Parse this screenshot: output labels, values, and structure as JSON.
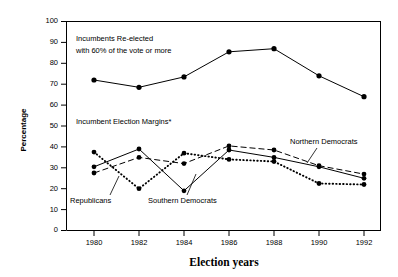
{
  "chart_data": {
    "type": "line",
    "title": "",
    "xlabel": "Election years",
    "ylabel": "Percentage",
    "x": [
      1980,
      1982,
      1984,
      1986,
      1988,
      1990,
      1992
    ],
    "xtick_labels": [
      "1980",
      "1982",
      "1984",
      "1986",
      "1988",
      "1990",
      "1992"
    ],
    "ytick_labels": [
      "0",
      "10",
      "20",
      "30",
      "40",
      "50",
      "60",
      "70",
      "80",
      "90",
      "100"
    ],
    "yticks": [
      0,
      10,
      20,
      30,
      40,
      50,
      60,
      70,
      80,
      90,
      100
    ],
    "ylim": [
      0,
      100
    ],
    "xlim": [
      1979,
      1993
    ],
    "grid": false,
    "legend_position": "inline-annotations",
    "series": [
      {
        "name": "Incumbents Re-elected with 60% of the vote or more",
        "style": "solid",
        "marker": "filled-circle",
        "values": [
          72,
          68.5,
          73.5,
          85.5,
          87,
          74,
          64
        ]
      },
      {
        "name": "Northern Democrats",
        "style": "dashed",
        "marker": "filled-circle",
        "values": [
          27.5,
          35,
          32,
          40.5,
          38.5,
          31,
          27
        ]
      },
      {
        "name": "Southern Democrats",
        "style": "solid",
        "marker": "filled-circle",
        "values": [
          30.5,
          39,
          19,
          38.5,
          35,
          30.5,
          25
        ]
      },
      {
        "name": "Republicans",
        "style": "dotted",
        "marker": "filled-circle",
        "values": [
          37.5,
          20,
          37,
          34,
          33,
          22.5,
          22
        ]
      }
    ],
    "annotations": [
      {
        "id": "top-group-label-1",
        "text": "Incumbents Re-elected"
      },
      {
        "id": "top-group-label-2",
        "text": "with 60% of the vote or more"
      },
      {
        "id": "margins-group-label",
        "text": "Incumbent Election Margins*"
      },
      {
        "id": "republicans-label",
        "text": "Republicans"
      },
      {
        "id": "southern-democrats-label",
        "text": "Southern Democrats"
      },
      {
        "id": "northern-democrats-label",
        "text": "Northern Democrats"
      }
    ]
  },
  "axes": {
    "y_title": "Percentage",
    "x_title": "Election years"
  }
}
